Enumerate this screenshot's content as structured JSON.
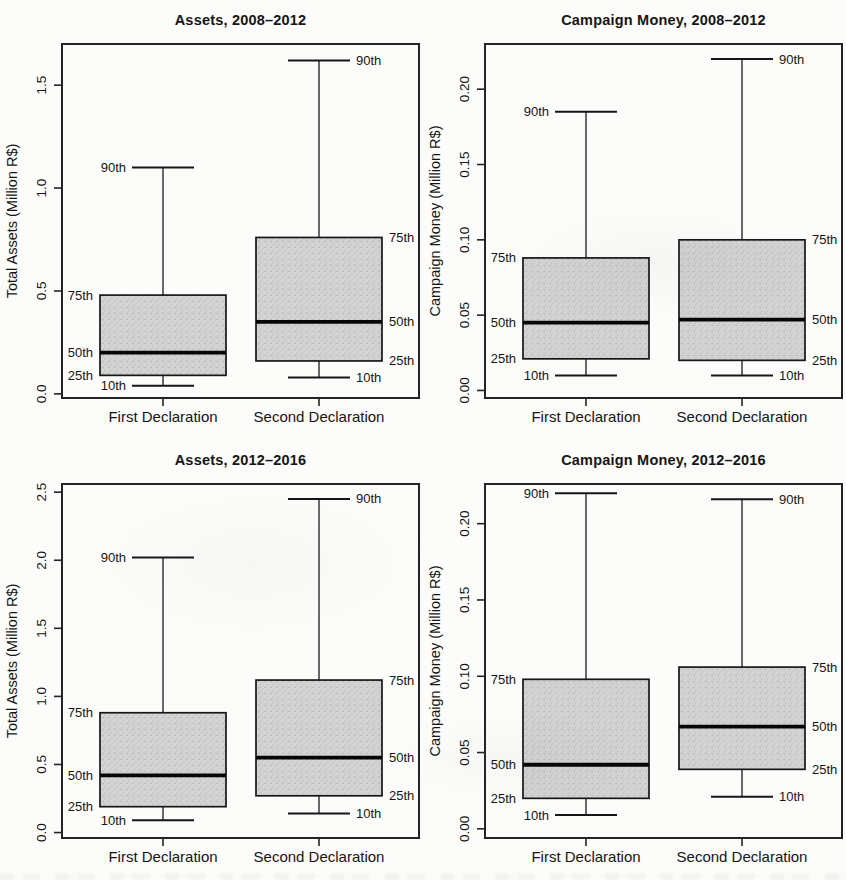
{
  "figure": {
    "kind": "boxplot-grid-2x2",
    "categories": [
      "First Declaration",
      "Second Declaration"
    ],
    "percentile_labels": {
      "p10": "10th",
      "p25": "25th",
      "p50": "50th",
      "p75": "75th",
      "p90": "90th"
    }
  },
  "style": {
    "background": "#fcfcfa",
    "box_fill": "#d3d3d3",
    "box_dot_dark": "#adadad",
    "box_dot_mid": "#c2c2c2",
    "line_color": "#1a1a1a"
  },
  "chart_data": [
    {
      "type": "boxplot",
      "title": "Assets, 2008–2012",
      "ylabel": "Total Assets (Million R$)",
      "xlabel": "",
      "categories": [
        "First Declaration",
        "Second Declaration"
      ],
      "ylim": [
        -0.02,
        1.7
      ],
      "yticks": [
        0.0,
        0.5,
        1.0,
        1.5
      ],
      "ytick_labels": [
        "0.0",
        "0.5",
        "1.0",
        "1.5"
      ],
      "grid": false,
      "series": [
        {
          "name": "First Declaration",
          "p10": 0.04,
          "p25": 0.09,
          "p50": 0.2,
          "p75": 0.48,
          "p90": 1.1
        },
        {
          "name": "Second Declaration",
          "p10": 0.08,
          "p25": 0.16,
          "p50": 0.35,
          "p75": 0.76,
          "p90": 1.62
        }
      ]
    },
    {
      "type": "boxplot",
      "title": "Campaign Money, 2008–2012",
      "ylabel": "Campaign Money (Million R$)",
      "xlabel": "",
      "categories": [
        "First Declaration",
        "Second Declaration"
      ],
      "ylim": [
        -0.005,
        0.23
      ],
      "yticks": [
        0.0,
        0.05,
        0.1,
        0.15,
        0.2
      ],
      "ytick_labels": [
        "0.00",
        "0.05",
        "0.10",
        "0.15",
        "0.20"
      ],
      "grid": false,
      "series": [
        {
          "name": "First Declaration",
          "p10": 0.01,
          "p25": 0.021,
          "p50": 0.045,
          "p75": 0.088,
          "p90": 0.185
        },
        {
          "name": "Second Declaration",
          "p10": 0.01,
          "p25": 0.02,
          "p50": 0.047,
          "p75": 0.1,
          "p90": 0.22
        }
      ]
    },
    {
      "type": "boxplot",
      "title": "Assets, 2012–2016",
      "ylabel": "Total Assets (Million R$)",
      "xlabel": "",
      "categories": [
        "First Declaration",
        "Second Declaration"
      ],
      "ylim": [
        -0.04,
        2.56
      ],
      "yticks": [
        0.0,
        0.5,
        1.0,
        1.5,
        2.0,
        2.5
      ],
      "ytick_labels": [
        "0.0",
        "0.5",
        "1.0",
        "1.5",
        "2.0",
        "2.5"
      ],
      "grid": false,
      "series": [
        {
          "name": "First Declaration",
          "p10": 0.09,
          "p25": 0.19,
          "p50": 0.42,
          "p75": 0.88,
          "p90": 2.02
        },
        {
          "name": "Second Declaration",
          "p10": 0.14,
          "p25": 0.27,
          "p50": 0.55,
          "p75": 1.12,
          "p90": 2.45
        }
      ]
    },
    {
      "type": "boxplot",
      "title": "Campaign Money, 2012–2016",
      "ylabel": "Campaign Money (Million R$)",
      "xlabel": "",
      "categories": [
        "First Declaration",
        "Second Declaration"
      ],
      "ylim": [
        -0.006,
        0.226
      ],
      "yticks": [
        0.0,
        0.05,
        0.1,
        0.15,
        0.2
      ],
      "ytick_labels": [
        "0.00",
        "0.05",
        "0.10",
        "0.15",
        "0.20"
      ],
      "grid": false,
      "series": [
        {
          "name": "First Declaration",
          "p10": 0.009,
          "p25": 0.02,
          "p50": 0.042,
          "p75": 0.098,
          "p90": 0.22
        },
        {
          "name": "Second Declaration",
          "p10": 0.021,
          "p25": 0.039,
          "p50": 0.067,
          "p75": 0.106,
          "p90": 0.216
        }
      ]
    }
  ]
}
